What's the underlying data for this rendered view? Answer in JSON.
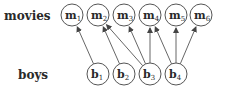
{
  "rows": {
    "top_label": "movies",
    "bottom_label": "boys"
  },
  "movies": [
    {
      "id": "m1",
      "base": "m",
      "sub": "1",
      "cx": 72
    },
    {
      "id": "m2",
      "base": "m",
      "sub": "2",
      "cx": 98
    },
    {
      "id": "m3",
      "base": "m",
      "sub": "3",
      "cx": 124
    },
    {
      "id": "m4",
      "base": "m",
      "sub": "4",
      "cx": 150
    },
    {
      "id": "m5",
      "base": "m",
      "sub": "5",
      "cx": 176
    },
    {
      "id": "m6",
      "base": "m",
      "sub": "6",
      "cx": 201
    }
  ],
  "boys": [
    {
      "id": "b1",
      "base": "b",
      "sub": "1",
      "cx": 98
    },
    {
      "id": "b2",
      "base": "b",
      "sub": "2",
      "cx": 124
    },
    {
      "id": "b3",
      "base": "b",
      "sub": "3",
      "cx": 150
    },
    {
      "id": "b4",
      "base": "b",
      "sub": "4",
      "cx": 176
    }
  ],
  "edges": [
    {
      "from": "b1",
      "to": "m1"
    },
    {
      "from": "b2",
      "to": "m2"
    },
    {
      "from": "b3",
      "to": "m2"
    },
    {
      "from": "b3",
      "to": "m3"
    },
    {
      "from": "b3",
      "to": "m4"
    },
    {
      "from": "b4",
      "to": "m4"
    },
    {
      "from": "b4",
      "to": "m5"
    },
    {
      "from": "b4",
      "to": "m6"
    }
  ],
  "colors": {
    "stroke": "#555555",
    "text": "#2a2a2a"
  }
}
